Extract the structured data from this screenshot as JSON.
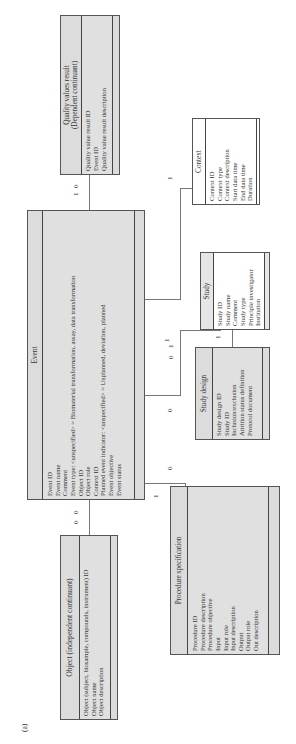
{
  "figure_label": "(a)",
  "entities": {
    "quality": {
      "title": "Quality values result\n(Dependent continuant)",
      "title_line1": "Quality values result",
      "title_line2": "(Dependent continuant)",
      "attributes": [
        "Quality value result ID",
        "Event ID",
        "Quality value result description"
      ]
    },
    "event": {
      "title": "Event",
      "attributes": [
        "Event ID",
        "Event name",
        "Comment",
        "Event type: <unspecified> = Biomaterial transformation, assay, data transformation",
        "Object ID",
        "Object role",
        "Context ID",
        "Planned event indicator: <unspecified> = Unplanned, deviation, planned",
        "Event objective",
        "Event status"
      ]
    },
    "context": {
      "title": "Context",
      "attributes": [
        "Context ID",
        "Context type",
        "Context description",
        "Start data time",
        "End data time",
        "Duration"
      ]
    },
    "study": {
      "title": "Study",
      "attributes": [
        "Study ID",
        "Study name",
        "Comment",
        "Study type",
        "Principle investigator",
        "Institution"
      ]
    },
    "study_design": {
      "title": "Study design",
      "attributes": [
        "Study design ID",
        "Study ID",
        "Inclusion/exclusion",
        "Attrition status definition",
        "Protocol document"
      ]
    },
    "procedure": {
      "title": "Procedure specification",
      "attributes": [
        "Procedure ID",
        "Procedure description",
        "Procedure objective",
        "Input",
        "Input role",
        "Input description",
        "Output",
        "Output role",
        "Out description"
      ]
    },
    "object": {
      "title": "Object (independent continuant)",
      "attributes": [
        "Object (subject, biosample, compounds, instrument) ID",
        "Object name",
        "Object description"
      ]
    }
  },
  "cardinalities": {
    "event_quality_a": "1",
    "event_quality_b": "0",
    "event_context": "1",
    "event_study_a": "0",
    "event_study_b": "1",
    "event_study_c": "1",
    "study_studydesign": "1",
    "event_studydesign": "0",
    "event_procedure_a": "0",
    "event_procedure_b": "1",
    "object_event_a": "0",
    "object_event_b": "0"
  }
}
